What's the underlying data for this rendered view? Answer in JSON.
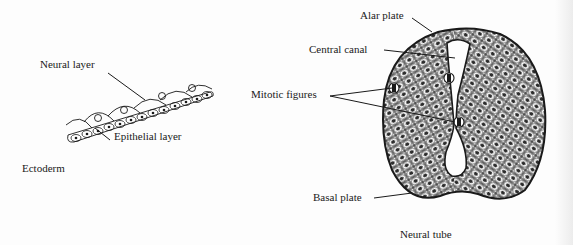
{
  "figure": {
    "left_panel": {
      "caption": "Ectoderm",
      "labels": {
        "neural_layer": "Neural layer",
        "epithelial_layer": "Epithelial layer"
      }
    },
    "right_panel": {
      "caption": "Neural tube",
      "labels": {
        "alar_plate": "Alar plate",
        "central_canal": "Central canal",
        "mitotic_figures": "Mitotic figures",
        "basal_plate": "Basal plate"
      }
    },
    "colors": {
      "ink": "#1a1a1a",
      "background": "#fdfdfd"
    }
  }
}
